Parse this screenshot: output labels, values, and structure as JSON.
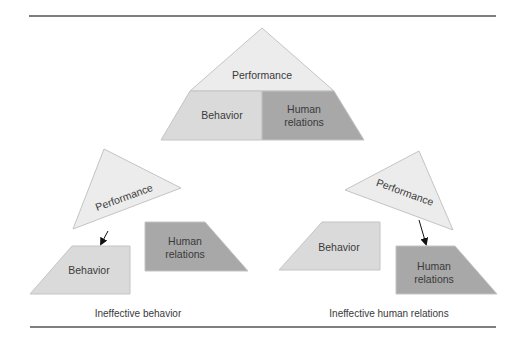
{
  "colors": {
    "performance_fill": "#ececec",
    "behavior_fill": "#dadada",
    "human_relations_fill": "#a8a8a8",
    "stroke": "#c4c4c4",
    "rule": "#555555",
    "text": "#3a3a3a"
  },
  "top_pyramid": {
    "apex_label": "Performance",
    "left_label": "Behavior",
    "right_label_line1": "Human",
    "right_label_line2": "relations"
  },
  "left_panel": {
    "triangle_label": "Performance",
    "behavior_label": "Behavior",
    "human_label_line1": "Human",
    "human_label_line2": "relations",
    "caption": "Ineffective behavior"
  },
  "right_panel": {
    "triangle_label": "Performance",
    "behavior_label": "Behavior",
    "human_label_line1": "Human",
    "human_label_line2": "relations",
    "caption": "Ineffective human relations"
  }
}
